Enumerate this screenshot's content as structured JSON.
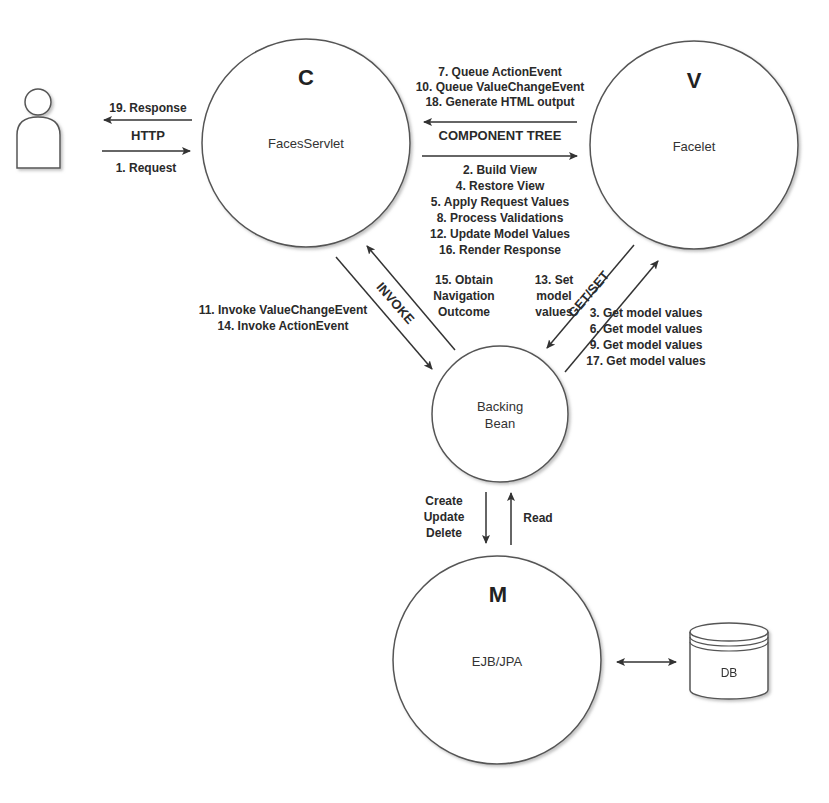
{
  "nodes": {
    "user": {
      "label": ""
    },
    "controller": {
      "letter": "C",
      "label": "FacesServlet"
    },
    "view": {
      "letter": "V",
      "label": "Facelet"
    },
    "backing_bean": {
      "label_line1": "Backing",
      "label_line2": "Bean"
    },
    "model": {
      "letter": "M",
      "label": "EJB/JPA"
    },
    "db": {
      "label": "DB"
    }
  },
  "edges": {
    "http": {
      "label": "HTTP",
      "response": "19. Response",
      "request": "1. Request"
    },
    "component_tree": {
      "label": "COMPONENT TREE",
      "to_controller": [
        "7. Queue ActionEvent",
        "10. Queue ValueChangeEvent",
        "18. Generate HTML output"
      ],
      "to_view": [
        "2. Build View",
        "4. Restore View",
        "5. Apply Request Values",
        "8. Process Validations",
        "12. Update Model Values",
        "16. Render Response"
      ]
    },
    "invoke": {
      "label": "INVOKE",
      "to_bean": [
        "11. Invoke ValueChangeEvent",
        "14. Invoke ActionEvent"
      ],
      "to_controller": [
        "15. Obtain",
        "Navigation",
        "Outcome"
      ]
    },
    "get_set": {
      "label": "GET/SET",
      "to_bean": [
        "13. Set",
        "model",
        "values"
      ],
      "to_view": [
        "3. Get model values",
        "6. Get model values",
        "9. Get model values",
        "17. Get model values"
      ]
    },
    "bean_model": {
      "to_model": [
        "Create",
        "Update",
        "Delete"
      ],
      "to_bean": [
        "Read"
      ]
    },
    "model_db": {
      "label": ""
    }
  },
  "colors": {
    "stroke": "#444444",
    "text": "#2a2a2a",
    "background": "#ffffff"
  }
}
